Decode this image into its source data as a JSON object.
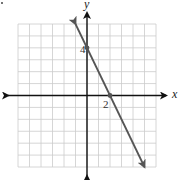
{
  "chart_data": {
    "type": "line",
    "title": "",
    "xlabel": "x",
    "ylabel": "y",
    "xlim": [
      -6,
      6
    ],
    "ylim": [
      -6,
      6
    ],
    "grid": true,
    "grid_step": 1,
    "legend": null,
    "equation": "y = -2x + 4",
    "slope": -2,
    "y_intercept": 4,
    "x_intercept": 2,
    "series": [
      {
        "name": "line",
        "x": [
          -1,
          5
        ],
        "y": [
          6,
          -6
        ],
        "arrows_both_ends": true
      }
    ],
    "points": [
      {
        "x": 0,
        "y": 4,
        "label": "4"
      },
      {
        "x": 2,
        "y": 0,
        "label": "2"
      }
    ],
    "tick_labels": {
      "x": [
        "2"
      ],
      "y": [
        "4"
      ]
    },
    "annotations": [
      "4",
      "2"
    ]
  },
  "labels": {
    "x_axis": "x",
    "y_axis": "y",
    "y_intercept": "4",
    "x_intercept": "2"
  },
  "colors": {
    "grid": "#cccccc",
    "axes": "#111111",
    "line": "#555555",
    "text": "#333333"
  }
}
